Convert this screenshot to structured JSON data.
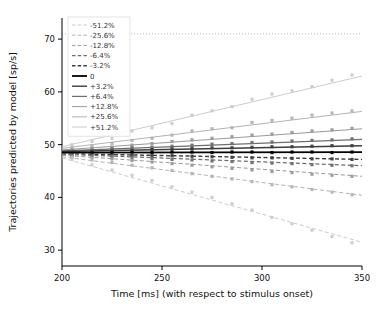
{
  "chart_data": {
    "type": "line",
    "title": "",
    "xlabel": "Time [ms] (with respect to stimulus onset)",
    "ylabel": "Trajectories predicted by model [sp/s]",
    "xlim": [
      200,
      350
    ],
    "ylim": [
      27,
      74
    ],
    "xticks": [
      200,
      250,
      300,
      350
    ],
    "xticklabels": [
      "200",
      "250",
      "300",
      "350"
    ],
    "yticks": [
      30,
      40,
      50,
      60,
      70
    ],
    "yticklabels": [
      "30",
      "40",
      "50",
      "60",
      "70"
    ],
    "grid": false,
    "legend_position": "upper-left",
    "legend_entries": [
      {
        "label": "-51.2%",
        "color": "#cccccc",
        "dash": "dashed",
        "width": 1.0
      },
      {
        "label": "-25.6%",
        "color": "#b3b3b3",
        "dash": "dashed",
        "width": 1.0
      },
      {
        "label": "-12.8%",
        "color": "#999999",
        "dash": "dashed",
        "width": 1.0
      },
      {
        "label": "-6.4%",
        "color": "#6e6e6e",
        "dash": "dashed",
        "width": 1.2
      },
      {
        "label": "-3.2%",
        "color": "#3d3d3d",
        "dash": "dashed",
        "width": 1.4
      },
      {
        "label": "0",
        "color": "#000000",
        "dash": "solid",
        "width": 1.8
      },
      {
        "label": "+3.2%",
        "color": "#3d3d3d",
        "dash": "solid",
        "width": 1.4
      },
      {
        "label": "+6.4%",
        "color": "#6e6e6e",
        "dash": "solid",
        "width": 1.2
      },
      {
        "label": "+12.8%",
        "color": "#999999",
        "dash": "solid",
        "width": 1.0
      },
      {
        "label": "+25.6%",
        "color": "#b3b3b3",
        "dash": "solid",
        "width": 1.0
      },
      {
        "label": "+51.2%",
        "color": "#cccccc",
        "dash": "solid",
        "width": 1.0
      }
    ],
    "series": [
      {
        "name": "+51.2%",
        "color": "#cccccc",
        "dash": "solid",
        "width": 1.0,
        "x": [
          200,
          350
        ],
        "y": [
          49.6,
          63.0
        ],
        "points_x": [
          205,
          215,
          225,
          235,
          245,
          255,
          265,
          275,
          285,
          295,
          305,
          315,
          325,
          335,
          345
        ],
        "points_y": [
          50.0,
          50.6,
          51.2,
          52.6,
          53.2,
          54.0,
          55.6,
          56.4,
          57.2,
          58.6,
          59.6,
          60.2,
          61.0,
          62.2,
          63.2
        ]
      },
      {
        "name": "+25.6%",
        "color": "#b3b3b3",
        "dash": "solid",
        "width": 1.0,
        "x": [
          200,
          350
        ],
        "y": [
          49.3,
          56.3
        ],
        "points_x": [
          205,
          215,
          225,
          235,
          245,
          255,
          265,
          275,
          285,
          295,
          305,
          315,
          325,
          335,
          345
        ],
        "points_y": [
          49.4,
          49.8,
          50.2,
          50.8,
          51.2,
          51.8,
          52.6,
          53.0,
          53.2,
          54.2,
          54.6,
          55.0,
          55.6,
          56.0,
          56.4
        ]
      },
      {
        "name": "+12.8%",
        "color": "#999999",
        "dash": "solid",
        "width": 1.0,
        "x": [
          200,
          350
        ],
        "y": [
          49.0,
          53.0
        ],
        "points_x": [
          205,
          215,
          225,
          235,
          245,
          255,
          265,
          275,
          285,
          295,
          305,
          315,
          325,
          335,
          345
        ],
        "points_y": [
          49.0,
          49.3,
          49.5,
          49.9,
          50.2,
          50.6,
          50.9,
          51.2,
          51.5,
          51.8,
          52.0,
          52.3,
          52.6,
          52.8,
          53.1
        ]
      },
      {
        "name": "+6.4%",
        "color": "#6e6e6e",
        "dash": "solid",
        "width": 1.2,
        "x": [
          200,
          350
        ],
        "y": [
          48.8,
          51.0
        ],
        "points_x": [
          205,
          215,
          225,
          235,
          245,
          255,
          265,
          275,
          285,
          295,
          305,
          315,
          325,
          335,
          345
        ],
        "points_y": [
          48.8,
          49.0,
          49.2,
          49.4,
          49.5,
          49.7,
          49.9,
          50.1,
          50.2,
          50.4,
          50.5,
          50.7,
          50.8,
          50.9,
          51.1
        ]
      },
      {
        "name": "+3.2%",
        "color": "#3d3d3d",
        "dash": "solid",
        "width": 1.4,
        "x": [
          200,
          350
        ],
        "y": [
          48.7,
          49.8
        ],
        "points_x": [
          205,
          215,
          225,
          235,
          245,
          255,
          265,
          275,
          285,
          295,
          305,
          315,
          325,
          335,
          345
        ],
        "points_y": [
          48.7,
          48.8,
          48.9,
          49.0,
          49.1,
          49.2,
          49.3,
          49.4,
          49.4,
          49.5,
          49.6,
          49.6,
          49.7,
          49.8,
          49.8
        ]
      },
      {
        "name": "0",
        "color": "#000000",
        "dash": "solid",
        "width": 1.8,
        "x": [
          200,
          350
        ],
        "y": [
          48.5,
          48.6
        ],
        "points_x": [
          205,
          215,
          225,
          235,
          245,
          255,
          265,
          275,
          285,
          295,
          305,
          315,
          325,
          335,
          345
        ],
        "points_y": [
          48.5,
          48.5,
          48.5,
          48.6,
          48.5,
          48.6,
          48.6,
          48.5,
          48.6,
          48.6,
          48.5,
          48.6,
          48.6,
          48.5,
          48.6
        ]
      },
      {
        "name": "-3.2%",
        "color": "#3d3d3d",
        "dash": "dashed",
        "width": 1.4,
        "x": [
          200,
          350
        ],
        "y": [
          48.3,
          47.2
        ],
        "points_x": [
          205,
          215,
          225,
          235,
          245,
          255,
          265,
          275,
          285,
          295,
          305,
          315,
          325,
          335,
          345
        ],
        "points_y": [
          48.3,
          48.2,
          48.1,
          48.0,
          47.9,
          47.9,
          47.8,
          47.7,
          47.6,
          47.5,
          47.5,
          47.4,
          47.3,
          47.3,
          47.2
        ]
      },
      {
        "name": "-6.4%",
        "color": "#6e6e6e",
        "dash": "dashed",
        "width": 1.2,
        "x": [
          200,
          350
        ],
        "y": [
          48.2,
          46.0
        ],
        "points_x": [
          205,
          215,
          225,
          235,
          245,
          255,
          265,
          275,
          285,
          295,
          305,
          315,
          325,
          335,
          345
        ],
        "points_y": [
          48.1,
          47.9,
          47.8,
          47.6,
          47.4,
          47.2,
          47.1,
          46.9,
          46.8,
          46.6,
          46.5,
          46.4,
          46.2,
          46.1,
          46.0
        ]
      },
      {
        "name": "-12.8%",
        "color": "#999999",
        "dash": "dashed",
        "width": 1.0,
        "x": [
          200,
          350
        ],
        "y": [
          48.0,
          44.0
        ],
        "points_x": [
          205,
          215,
          225,
          235,
          245,
          255,
          265,
          275,
          285,
          295,
          305,
          315,
          325,
          335,
          345
        ],
        "points_y": [
          47.9,
          47.6,
          47.3,
          47.0,
          46.7,
          46.4,
          46.1,
          45.8,
          45.5,
          45.2,
          44.9,
          44.7,
          44.4,
          44.2,
          44.0
        ]
      },
      {
        "name": "-25.6%",
        "color": "#b3b3b3",
        "dash": "dashed",
        "width": 1.0,
        "x": [
          200,
          350
        ],
        "y": [
          47.7,
          40.4
        ],
        "points_x": [
          205,
          215,
          225,
          235,
          245,
          255,
          265,
          275,
          285,
          295,
          305,
          315,
          325,
          335,
          345
        ],
        "points_y": [
          47.6,
          47.1,
          46.6,
          46.1,
          45.6,
          45.1,
          44.5,
          44.0,
          43.5,
          43.0,
          42.4,
          42.0,
          41.5,
          41.0,
          40.5
        ]
      },
      {
        "name": "-51.2%",
        "color": "#cccccc",
        "dash": "dashed",
        "width": 1.0,
        "x": [
          200,
          350
        ],
        "y": [
          47.5,
          31.5
        ],
        "points_x": [
          205,
          215,
          225,
          235,
          245,
          255,
          265,
          275,
          285,
          295,
          305,
          315,
          325,
          335,
          345
        ],
        "points_y": [
          47.2,
          46.2,
          45.2,
          44.2,
          43.2,
          42.0,
          41.0,
          40.0,
          38.8,
          37.6,
          36.2,
          35.0,
          33.8,
          32.6,
          31.4
        ]
      }
    ],
    "threshold_line": {
      "y": 71.0,
      "color": "#bbbbbb",
      "dash": "dotted"
    }
  }
}
